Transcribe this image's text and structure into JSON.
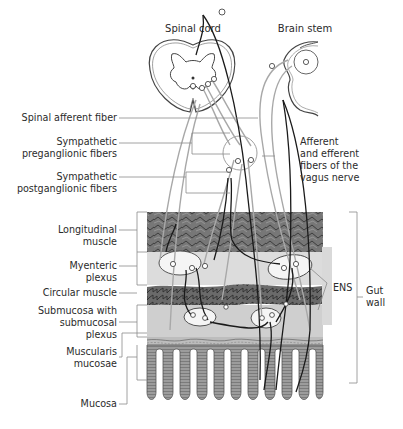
{
  "diagram": {
    "title_labels": {
      "spinal_cord": "Spinal cord",
      "brain_stem": "Brain stem"
    },
    "left_labels": [
      {
        "id": "spinal-afferent-fiber",
        "lines": [
          "Spinal afferent fiber"
        ]
      },
      {
        "id": "sympathetic-preganglionic-fibers",
        "lines": [
          "Sympathetic",
          "preganglionic fibers"
        ]
      },
      {
        "id": "sympathetic-postganglionic-fibers",
        "lines": [
          "Sympathetic",
          "postganglionic fibers"
        ]
      },
      {
        "id": "longitudinal-muscle",
        "lines": [
          "Longitudinal",
          "muscle"
        ]
      },
      {
        "id": "myenteric-plexus",
        "lines": [
          "Myenteric",
          "plexus"
        ]
      },
      {
        "id": "circular-muscle",
        "lines": [
          "Circular muscle"
        ]
      },
      {
        "id": "submucosa",
        "lines": [
          "Submucosa with",
          "submucosal",
          "plexus"
        ]
      },
      {
        "id": "muscularis-mucosae",
        "lines": [
          "Muscularis",
          "mucosae"
        ]
      },
      {
        "id": "mucosa",
        "lines": [
          "Mucosa"
        ]
      }
    ],
    "right_labels": [
      {
        "id": "vagus-fibers",
        "lines": [
          "Afferent",
          "and efferent",
          "fibers of the",
          "vagus nerve"
        ]
      },
      {
        "id": "ens",
        "lines": [
          "ENS"
        ]
      },
      {
        "id": "gut-wall",
        "lines": [
          "Gut",
          "wall"
        ]
      }
    ],
    "colors": {
      "muscle_dark": "#6e6e6e",
      "layer_light": "#d4d4d4",
      "plexus_bg": "#e6e6e6",
      "ganglion_fill": "#f4f4f4",
      "mucosa": "#bdbdbd",
      "fiber_black": "#1a1a1a",
      "fiber_gray": "#a9a9a9",
      "leader": "#8a8a8a"
    }
  }
}
